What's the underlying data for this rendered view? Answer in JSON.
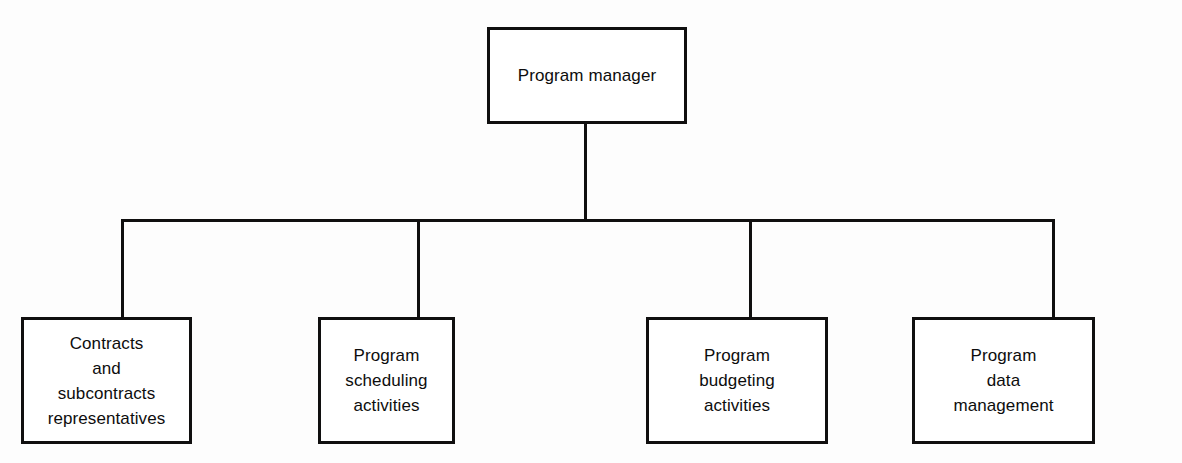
{
  "chart_data": {
    "type": "diagram",
    "subtype": "organizational-hierarchy-tree",
    "title": "",
    "orientation": "top-down",
    "root": {
      "id": "root",
      "label": "Program manager"
    },
    "children": [
      {
        "id": "child-0",
        "label": "Contracts\nand\nsubcontracts\nrepresentatives"
      },
      {
        "id": "child-1",
        "label": "Program\nscheduling\nactivities"
      },
      {
        "id": "child-2",
        "label": "Program\nbudgeting\nactivities"
      },
      {
        "id": "child-3",
        "label": "Program\ndata\nmanagement"
      }
    ],
    "edges": [
      {
        "from": "root",
        "to": "child-0"
      },
      {
        "from": "root",
        "to": "child-1"
      },
      {
        "from": "root",
        "to": "child-2"
      },
      {
        "from": "root",
        "to": "child-3"
      }
    ],
    "colors": {
      "background": "#fdfdfd",
      "box_fill": "#ffffff",
      "stroke": "#100f0f",
      "text": "#0d0d0d"
    }
  }
}
